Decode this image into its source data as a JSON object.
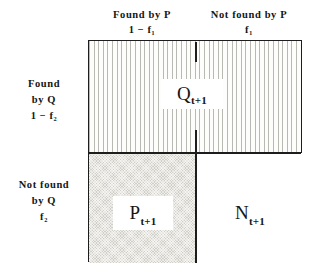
{
  "figure": {
    "background_color": "#ffffff",
    "line_color": "#1d1d1d"
  },
  "columns": [
    {
      "id": "found-by-p",
      "line1": "Found  by  P",
      "line2": "1 − f₁"
    },
    {
      "id": "not-found-by-p",
      "line1": "Not  found  by  P",
      "line2": "f₁"
    }
  ],
  "rows": [
    {
      "id": "found-by-q",
      "line1": "Found",
      "line2": "by  Q",
      "line3": "1 − f₂"
    },
    {
      "id": "not-found-by-q",
      "line1": "Not  found",
      "line2": "by  Q",
      "line3": "f₂"
    }
  ],
  "cells": [
    {
      "id": "q-cell",
      "base": "Q",
      "subscript": "t+1",
      "label": "Q t+1",
      "fill": "vertical-hatch",
      "fill_color": "#b9b9b4",
      "spans": "full-width-top-row"
    },
    {
      "id": "p-cell",
      "base": "P",
      "subscript": "t+1",
      "label": "P t+1",
      "fill": "stipple-gray",
      "fill_color": "#e9e8e2",
      "spans": "bottom-left"
    },
    {
      "id": "n-cell",
      "base": "N",
      "subscript": "t+1",
      "label": "N t+1",
      "fill": "white",
      "fill_color": "#ffffff",
      "spans": "bottom-right"
    }
  ]
}
